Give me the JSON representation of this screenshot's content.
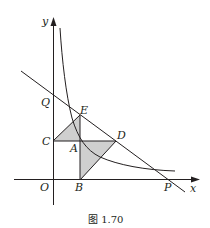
{
  "figure": {
    "caption": "图 1.70",
    "axes": {
      "x_label": "x",
      "y_label": "y",
      "origin_label": "O"
    },
    "points": {
      "Q": "Q",
      "E": "E",
      "C": "C",
      "A": "A",
      "D": "D",
      "B": "B",
      "P": "P"
    },
    "elements": [
      "hyperbola curve in first quadrant",
      "line through Q, E, D, P",
      "shaded triangle C-E-A",
      "shaded triangle A-D-B"
    ],
    "colors": {
      "stroke": "#231f20",
      "shade": "#cfcfcf",
      "background": "#ffffff"
    }
  }
}
